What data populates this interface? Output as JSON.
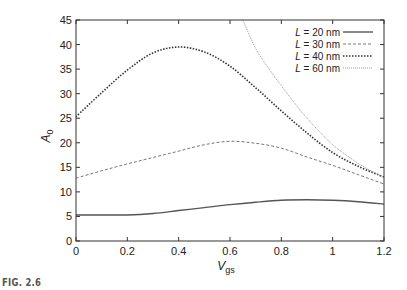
{
  "figure_label": "FIG. 2.6",
  "chart_data": {
    "type": "line",
    "title": "",
    "xlabel": "V",
    "xlabel_sub": "gs",
    "ylabel": "A",
    "ylabel_sub": "0",
    "xlim": [
      0,
      1.2
    ],
    "ylim": [
      0,
      45
    ],
    "xticks": [
      0,
      0.2,
      0.4,
      0.6,
      0.8,
      1,
      1.2
    ],
    "xtick_labels": [
      "0",
      "0.2",
      "0.4",
      "0.6",
      "0.8",
      "1",
      "1.2"
    ],
    "yticks": [
      0,
      5,
      10,
      15,
      20,
      25,
      30,
      35,
      40,
      45
    ],
    "ytick_labels": [
      "0",
      "5",
      "10",
      "15",
      "20",
      "25",
      "30",
      "35",
      "40",
      "45"
    ],
    "grid": false,
    "legend_position": "upper right",
    "series": [
      {
        "name": "L = 20 nm",
        "legend_var": "L",
        "legend_rest": " = 20 nm",
        "style": "solid",
        "color": "#555555",
        "x": [
          0,
          0.1,
          0.2,
          0.3,
          0.4,
          0.5,
          0.6,
          0.7,
          0.8,
          0.9,
          1.0,
          1.1,
          1.2
        ],
        "y": [
          5.3,
          5.3,
          5.3,
          5.6,
          6.2,
          6.8,
          7.4,
          7.9,
          8.3,
          8.4,
          8.3,
          8.0,
          7.5
        ]
      },
      {
        "name": "L = 30 nm",
        "legend_var": "L",
        "legend_rest": " = 30 nm",
        "style": "dashed",
        "color": "#777777",
        "x": [
          0,
          0.1,
          0.2,
          0.3,
          0.4,
          0.5,
          0.6,
          0.7,
          0.8,
          0.9,
          1.0,
          1.1,
          1.2
        ],
        "y": [
          12.8,
          14.3,
          15.7,
          17.0,
          18.3,
          19.6,
          20.3,
          19.9,
          18.9,
          17.1,
          15.4,
          13.5,
          11.6
        ]
      },
      {
        "name": "L = 40 nm",
        "legend_var": "L",
        "legend_rest": " = 40 nm",
        "style": "dotted",
        "color": "#333333",
        "x": [
          0,
          0.1,
          0.2,
          0.3,
          0.4,
          0.5,
          0.6,
          0.7,
          0.8,
          0.9,
          1.0,
          1.1,
          1.2
        ],
        "y": [
          25.3,
          30.2,
          34.8,
          38.3,
          39.5,
          38.5,
          35.6,
          31.2,
          26.5,
          22.0,
          18.0,
          15.2,
          13.0
        ]
      },
      {
        "name": "L = 60 nm",
        "legend_var": "L",
        "legend_rest": " = 60 nm",
        "style": "dotted-fine",
        "color": "#999999",
        "x": [
          0.65,
          0.7,
          0.75,
          0.8,
          0.85,
          0.9,
          0.95,
          1.0,
          1.05,
          1.1,
          1.15,
          1.2
        ],
        "y": [
          45.0,
          39.2,
          35.2,
          31.6,
          28.2,
          25.0,
          22.2,
          19.6,
          17.6,
          15.8,
          14.3,
          13.0
        ]
      }
    ]
  }
}
